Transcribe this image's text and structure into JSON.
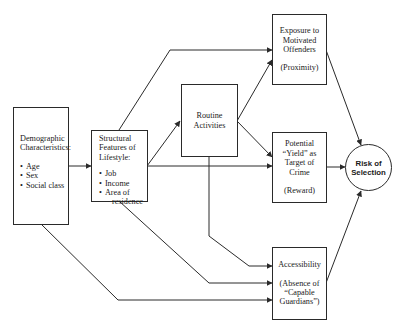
{
  "diagram": {
    "nodes": {
      "demographic": {
        "title_line1": "Demographic",
        "title_line2": "Characteristics:",
        "items": [
          "Age",
          "Sex",
          "Social class"
        ]
      },
      "structural": {
        "title_line1": "Structural",
        "title_line2": "Features of",
        "title_line3": "Lifestyle:",
        "items": [
          "Job",
          "Income",
          "Area of",
          "residence"
        ]
      },
      "routine": {
        "line1": "Routine",
        "line2": "Activities"
      },
      "exposure": {
        "line1": "Exposure to",
        "line2": "Motivated",
        "line3": "Offenders",
        "sub": "(Proximity)"
      },
      "potential": {
        "line1": "Potential",
        "line2": "“Yield” as",
        "line3": "Target of",
        "line4": "Crime",
        "sub": "(Reward)"
      },
      "accessibility": {
        "line1": "Accessibility",
        "sub1": "(Absence of",
        "sub2": "“Capable",
        "sub3": "Guardians”)"
      },
      "risk": {
        "line1": "Risk of",
        "line2": "Selection"
      }
    },
    "edges": [
      {
        "from": "demographic",
        "to": "structural"
      },
      {
        "from": "demographic",
        "to": "accessibility"
      },
      {
        "from": "structural",
        "to": "exposure"
      },
      {
        "from": "structural",
        "to": "routine"
      },
      {
        "from": "structural",
        "to": "potential"
      },
      {
        "from": "structural",
        "to": "accessibility"
      },
      {
        "from": "routine",
        "to": "exposure"
      },
      {
        "from": "routine",
        "to": "potential"
      },
      {
        "from": "routine",
        "to": "accessibility"
      },
      {
        "from": "exposure",
        "to": "risk"
      },
      {
        "from": "potential",
        "to": "risk"
      },
      {
        "from": "accessibility",
        "to": "risk"
      }
    ],
    "colors": {
      "line": "#2a2a2a",
      "background": "#ffffff",
      "text": "#1a1a1a"
    }
  }
}
